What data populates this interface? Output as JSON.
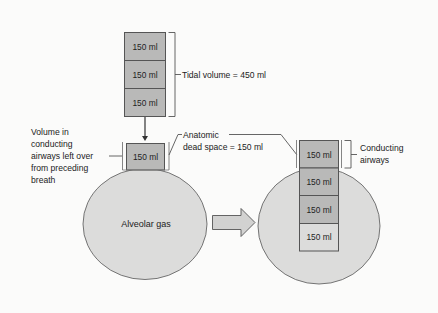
{
  "diagram": {
    "tidal_stack": {
      "boxes": [
        {
          "label": "150 ml"
        },
        {
          "label": "150 ml"
        },
        {
          "label": "150 ml"
        }
      ],
      "bracket_label": "Tidal volume = 450 ml"
    },
    "left_lung": {
      "dead_space_box": {
        "label": "150 ml"
      },
      "leftover_label_lines": [
        "Volume in",
        "conducting",
        "airways left over",
        "from preceding",
        "breath"
      ],
      "alveolar_label": "Alveolar gas"
    },
    "dead_space_callout": {
      "lines": [
        "Anatomic",
        "dead space = 150 ml"
      ]
    },
    "transition_arrow": {
      "icon": "right-block-arrow"
    },
    "right_lung": {
      "conducting_box": {
        "label": "150 ml"
      },
      "alveolar_boxes": [
        {
          "label": "150 ml"
        },
        {
          "label": "150 ml"
        },
        {
          "label": "150 ml"
        }
      ],
      "bracket_label_lines": [
        "Conducting",
        "airways"
      ]
    },
    "colors": {
      "box_fill": "#b9b9b8",
      "circle_fill": "#dcdcdb",
      "stroke": "#555555",
      "background": "#fbfbfa"
    }
  }
}
